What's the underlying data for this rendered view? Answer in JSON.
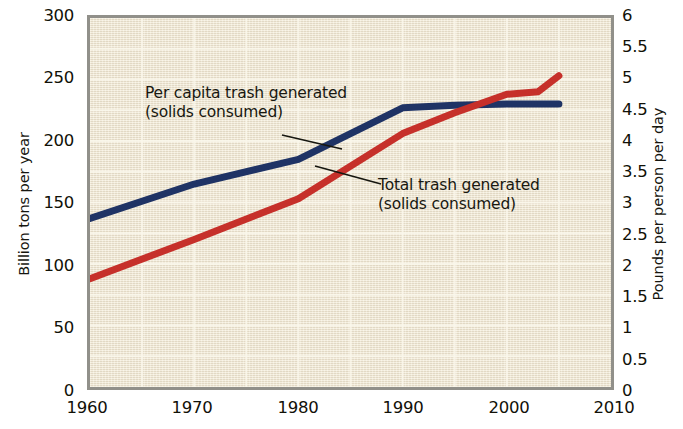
{
  "chart_data": {
    "type": "line",
    "title": "",
    "xlabel": "",
    "ylabel": "Billion tons per year",
    "y2label": "Pounds per person per day",
    "xlim": [
      1960,
      2010
    ],
    "ylim": [
      0,
      300
    ],
    "y2lim": [
      0,
      6
    ],
    "grid": true,
    "legend": "annotations-on-plot",
    "x_ticks": [
      "1960",
      "1970",
      "1980",
      "1990",
      "2000",
      "2010"
    ],
    "x_tick_values": [
      1960,
      1970,
      1980,
      1990,
      2000,
      2010
    ],
    "y_ticks": [
      "0",
      "50",
      "100",
      "150",
      "200",
      "250",
      "300"
    ],
    "y_tick_values": [
      0,
      50,
      100,
      150,
      200,
      250,
      300
    ],
    "y2_ticks": [
      "0",
      "0.5",
      "1",
      "1.5",
      "2",
      "2.5",
      "3",
      "3.5",
      "4",
      "4.5",
      "5",
      "5.5",
      "6"
    ],
    "y2_tick_values": [
      0,
      0.5,
      1,
      1.5,
      2,
      2.5,
      3,
      3.5,
      4,
      4.5,
      5,
      5.5,
      6
    ],
    "series": [
      {
        "name": "Per capita trash generated (solids consumed)",
        "color": "#1f3365",
        "axis": "left",
        "x": [
          1960,
          1970,
          1980,
          1990,
          1995,
          2000,
          2005
        ],
        "values": [
          137,
          165,
          185,
          227,
          229,
          230,
          230
        ]
      },
      {
        "name": "Total trash generated (solids consumed)",
        "color": "#c6302a",
        "axis": "left",
        "x": [
          1960,
          1970,
          1980,
          1990,
          1995,
          2000,
          2003,
          2005
        ],
        "values": [
          88,
          120,
          153,
          206,
          223,
          238,
          240,
          253
        ]
      }
    ],
    "annotations": [
      {
        "id": "per-capita",
        "line1": "Per capita trash generated",
        "line2": "(solids consumed)",
        "target_series": "Per capita trash generated (solids consumed)"
      },
      {
        "id": "total",
        "line1": "Total trash generated",
        "line2": "(solids consumed)",
        "target_series": "Total trash generated (solids consumed)"
      }
    ],
    "colors": {
      "plot_background": "#e9e1ce",
      "plot_border": "#91908a",
      "gridline": "#fbf7ea",
      "blue_series": "#1f3365",
      "red_series": "#c6302a",
      "text": "#16160f",
      "page_background": "#ffffff"
    }
  }
}
